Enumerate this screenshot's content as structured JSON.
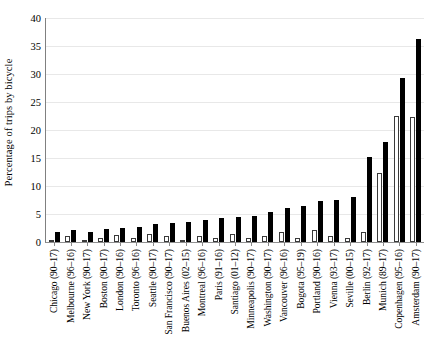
{
  "chart_data": {
    "type": "bar",
    "title": "",
    "xlabel": "",
    "ylabel": "Percentage of trips by bicycle",
    "ylim": [
      0,
      40
    ],
    "ytick_labels": [
      "0",
      "5",
      "10",
      "15",
      "20",
      "25",
      "30",
      "35",
      "40"
    ],
    "ytick_values": [
      0,
      5,
      10,
      15,
      20,
      25,
      30,
      35,
      40
    ],
    "grid": true,
    "legend_position": "none",
    "categories": [
      "Chicago (90–17)",
      "Melbourne (96–16)",
      "New York (90–17)",
      "Boston (90–17)",
      "London (90–16)",
      "Toronto (96–16)",
      "Seattle (90–17)",
      "San Francisco (90–17)",
      "Buenos Aires (02–15)",
      "Montreal (96–16)",
      "Paris (91–16)",
      "Santiago (01–12)",
      "Minneapolis (90–17)",
      "Washington (90–17)",
      "Vancouver (96–16)",
      "Bogota (95–19)",
      "Portland (90–16)",
      "Vienna (93–17)",
      "Seville (00–15)",
      "Berlin (92–17)",
      "Munich (89–17)",
      "Copenhagen (95–16)",
      "Amsterdam (90–17)"
    ],
    "series": [
      {
        "name": "First year",
        "color": "#ffffff",
        "values": [
          0.3,
          1.1,
          0.4,
          0.8,
          1.2,
          0.7,
          1.4,
          1.0,
          0.4,
          1.0,
          0.8,
          1.5,
          0.8,
          1.0,
          1.8,
          0.8,
          2.2,
          1.1,
          0.7,
          1.8,
          12.3,
          22.5,
          22.4
        ]
      },
      {
        "name": "Latest year",
        "color": "#000000",
        "values": [
          1.7,
          2.1,
          1.8,
          2.3,
          2.5,
          2.7,
          3.2,
          3.4,
          3.6,
          3.9,
          4.2,
          4.4,
          4.6,
          5.3,
          6.1,
          6.4,
          7.3,
          7.5,
          8.0,
          15.2,
          17.8,
          29.3,
          36.3
        ]
      }
    ]
  }
}
